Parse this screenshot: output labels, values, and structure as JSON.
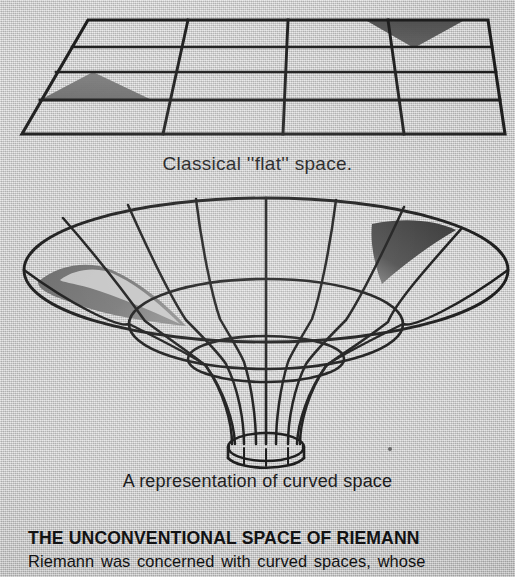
{
  "page": {
    "background_color": "#cecece",
    "ink_color": "#1a1a1a",
    "shade_color": "#6e6e6e",
    "shade_color_dark": "#3a3a3a",
    "width": 515,
    "height": 577
  },
  "figures": {
    "flat": {
      "name": "Classical flat space grid",
      "caption": "Classical ''flat'' space.",
      "columns": 4,
      "rows": 4,
      "shaded_regions": [
        {
          "name": "left-up-triangle",
          "orientation": "apex-up",
          "color": "#6f6f6f"
        },
        {
          "name": "top-right-triangle",
          "orientation": "apex-down",
          "color": "#555555"
        }
      ]
    },
    "curved": {
      "name": "Curved space funnel",
      "caption": "A representation of curved space",
      "meridians": 9,
      "latitudes": 4,
      "shaded_regions": [
        {
          "name": "left-crescent",
          "color": "#6e6e6e"
        },
        {
          "name": "right-wedge",
          "color": "#3c3c3c"
        }
      ]
    }
  },
  "article": {
    "headline": "THE UNCONVENTIONAL SPACE OF RIEMANN",
    "body_line_1": "Riemann was concerned with curved spaces, whose"
  }
}
